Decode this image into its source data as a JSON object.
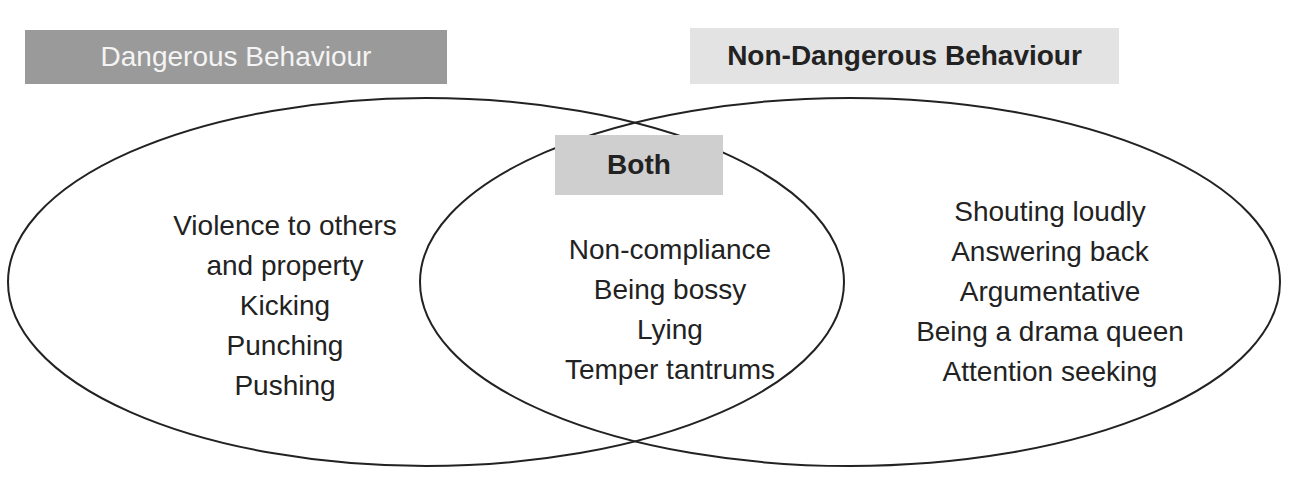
{
  "diagram": {
    "type": "venn",
    "colors": {
      "dangerous_label_bg": "#9a9a9a",
      "dangerous_label_text": "#f4f4f4",
      "non_dangerous_label_bg": "#e3e3e3",
      "both_label_bg": "#cfcfcf",
      "text": "#222222",
      "outline": "#222222"
    },
    "sets": {
      "dangerous": {
        "label": "Dangerous Behaviour",
        "items": [
          "Violence to others",
          "and property",
          "Kicking",
          "Punching",
          "Pushing"
        ]
      },
      "both": {
        "label": "Both",
        "items": [
          "Non-compliance",
          "Being bossy",
          "Lying",
          "Temper tantrums"
        ]
      },
      "non_dangerous": {
        "label": "Non-Dangerous Behaviour",
        "items": [
          "Shouting loudly",
          "Answering back",
          "Argumentative",
          "Being a drama queen",
          "Attention seeking"
        ]
      }
    }
  }
}
